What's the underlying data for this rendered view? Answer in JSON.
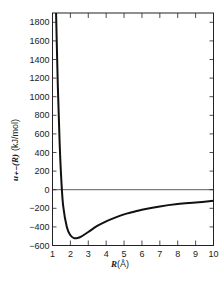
{
  "chart_data": {
    "type": "line",
    "title": "",
    "xlabel": "R(Å)",
    "xlabel_main": "R",
    "xlabel_unit": "(Å)",
    "ylabel": "u₊₋(R) (kJ/mol)",
    "ylabel_main": "u₊₋(R)",
    "ylabel_unit": "(kJ/mol)",
    "xlim": [
      1,
      10
    ],
    "ylim": [
      -600,
      1900
    ],
    "x_ticks": [
      "1",
      "2",
      "3",
      "4",
      "5",
      "6",
      "7",
      "8",
      "9",
      "10"
    ],
    "y_ticks": [
      "1800",
      "1600",
      "1400",
      "1200",
      "1000",
      "800",
      "600",
      "400",
      "200",
      "0",
      "−200",
      "−400",
      "−600"
    ],
    "zero_line": true,
    "grid": false,
    "series": [
      {
        "name": "u+-(R)",
        "x": [
          1.2,
          1.3,
          1.4,
          1.5,
          1.6,
          1.8,
          2.0,
          2.2,
          2.4,
          2.6,
          3.0,
          3.5,
          4.0,
          4.5,
          5.0,
          5.5,
          6.0,
          7.0,
          8.0,
          9.0,
          10.0
        ],
        "y": [
          1900,
          1100,
          500,
          80,
          -180,
          -400,
          -490,
          -520,
          -520,
          -505,
          -455,
          -390,
          -340,
          -300,
          -265,
          -240,
          -215,
          -180,
          -155,
          -138,
          -120
        ]
      }
    ]
  }
}
